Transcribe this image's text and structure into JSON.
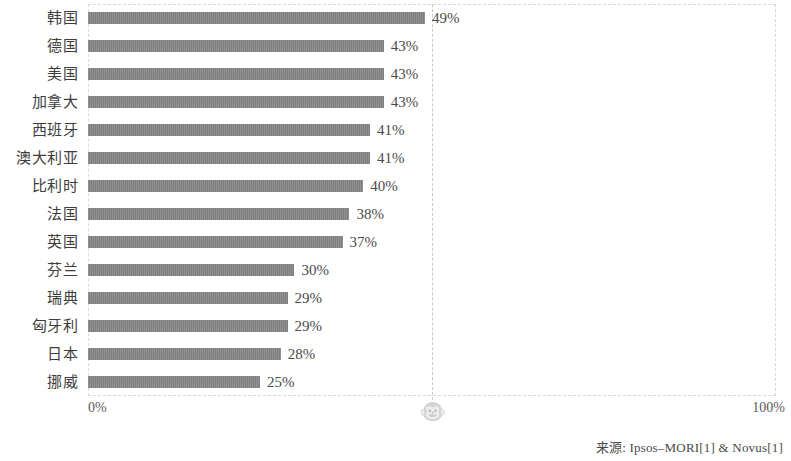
{
  "chart_data": {
    "type": "bar",
    "orientation": "horizontal",
    "title": "",
    "xlabel": "",
    "ylabel": "",
    "xlim": [
      0,
      100
    ],
    "xticks": [
      "0%",
      "100%"
    ],
    "grid": true,
    "gridline_at": 50,
    "legend": null,
    "categories": [
      "韩国",
      "德国",
      "美国",
      "加拿大",
      "西班牙",
      "澳大利亚",
      "比利时",
      "法国",
      "英国",
      "芬兰",
      "瑞典",
      "匈牙利",
      "日本",
      "挪威"
    ],
    "values": [
      49,
      43,
      43,
      43,
      41,
      41,
      40,
      38,
      37,
      30,
      29,
      29,
      28,
      25
    ],
    "value_labels": [
      "49%",
      "43%",
      "43%",
      "43%",
      "41%",
      "41%",
      "40%",
      "38%",
      "37%",
      "30%",
      "29%",
      "29%",
      "28%",
      "25%"
    ],
    "bar_color": "#858585",
    "gridline_color": "#c9c9c9",
    "axis_color": "#d8d8d8"
  },
  "axis": {
    "left_tick": "0%",
    "right_tick": "100%"
  },
  "marker": {
    "icon": "monkey-face-icon",
    "glyph": "🐵",
    "position_pct": 50
  },
  "footer": {
    "source": "来源: Ipsos–MORI[1] & Novus[1]"
  }
}
